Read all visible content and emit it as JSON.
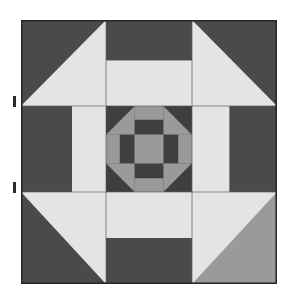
{
  "canvas": {
    "width": 287,
    "height": 297,
    "background": "#ffffff",
    "title": "Quilt Block Pattern"
  },
  "palette": {
    "dark": "#4a4a4a",
    "darker": "#3f3f3f",
    "medium": "#9a9a9a",
    "medium_light": "#a8a8a8",
    "light": "#e4e4e4",
    "light_alt": "#e0e0e0",
    "outline": "#2a2a2a",
    "grid_line": "#5a5a5a",
    "background": "#ffffff"
  },
  "block": {
    "name": "nine-patch-quilt-block",
    "x": 21,
    "y": 20,
    "width": 256,
    "height": 264,
    "grid": 3,
    "grid_x": [
      21,
      106,
      192,
      277
    ],
    "grid_y": [
      20,
      106,
      192,
      284
    ],
    "outline_color": "#2a2a2a",
    "outline_width": 1.6
  },
  "units": {
    "corners": [
      {
        "name": "corner-top-left",
        "type": "half-square-triangle",
        "x": 21,
        "y": 20,
        "w": 85,
        "h": 86,
        "triangle_a_color": "#4a4a4a",
        "triangle_b_color": "#e4e4e4",
        "diagonal": "tl-br",
        "point_direction": "inward"
      },
      {
        "name": "corner-top-right",
        "type": "half-square-triangle",
        "x": 192,
        "y": 20,
        "w": 85,
        "h": 86,
        "triangle_a_color": "#4a4a4a",
        "triangle_b_color": "#e4e4e4",
        "diagonal": "tr-bl",
        "point_direction": "inward"
      },
      {
        "name": "corner-bottom-left",
        "type": "half-square-triangle",
        "x": 21,
        "y": 192,
        "w": 85,
        "h": 92,
        "triangle_a_color": "#4a4a4a",
        "triangle_b_color": "#e4e4e4",
        "diagonal": "tr-bl",
        "point_direction": "inward"
      },
      {
        "name": "corner-bottom-right",
        "type": "half-square-triangle",
        "x": 192,
        "y": 192,
        "w": 85,
        "h": 92,
        "triangle_a_color": "#9a9a9a",
        "triangle_b_color": "#e4e4e4",
        "diagonal": "tl-br",
        "point_direction": "inward"
      }
    ],
    "edges": [
      {
        "name": "edge-top-center",
        "type": "split-rectangle",
        "x": 106,
        "y": 20,
        "w": 86,
        "h": 86,
        "outer_color": "#4a4a4a",
        "inner_color": "#e4e4e4",
        "split_fraction": 0.47,
        "orientation": "horizontal-outer-top"
      },
      {
        "name": "edge-middle-left",
        "type": "split-rectangle",
        "x": 21,
        "y": 106,
        "w": 85,
        "h": 86,
        "outer_color": "#4a4a4a",
        "inner_color": "#e4e4e4",
        "split_fraction": 0.6,
        "orientation": "vertical-outer-left"
      },
      {
        "name": "edge-middle-right",
        "type": "split-rectangle",
        "x": 192,
        "y": 106,
        "w": 85,
        "h": 86,
        "outer_color": "#4a4a4a",
        "inner_color": "#e4e4e4",
        "split_fraction": 0.56,
        "orientation": "vertical-outer-right"
      },
      {
        "name": "edge-bottom-center",
        "type": "split-rectangle",
        "x": 106,
        "y": 192,
        "w": 86,
        "h": 92,
        "outer_color": "#4a4a4a",
        "inner_color": "#e4e4e4",
        "split_fraction": 0.5,
        "orientation": "horizontal-outer-bottom"
      }
    ],
    "medallion": {
      "name": "center-medallion",
      "type": "churn-dash-shoofly",
      "x": 106,
      "y": 106,
      "w": 86,
      "h": 86,
      "background_color": "#9a9a9a",
      "cell": 28.67,
      "corners": [
        {
          "name": "medallion-corner-top-left",
          "diagonal": "tl-br",
          "dark_color": "#3f3f3f",
          "light_color": "#9a9a9a"
        },
        {
          "name": "medallion-corner-top-right",
          "diagonal": "tr-bl",
          "dark_color": "#3f3f3f",
          "light_color": "#9a9a9a"
        },
        {
          "name": "medallion-corner-bottom-left",
          "diagonal": "tr-bl",
          "dark_color": "#3f3f3f",
          "light_color": "#9a9a9a"
        },
        {
          "name": "medallion-corner-bottom-right",
          "diagonal": "tl-br",
          "dark_color": "#3f3f3f",
          "light_color": "#9a9a9a"
        }
      ],
      "bars": [
        {
          "name": "medallion-bar-top",
          "bar_color": "#3f3f3f",
          "fill_color": "#9a9a9a",
          "orientation": "horizontal",
          "bar_side": "inner"
        },
        {
          "name": "medallion-bar-bottom",
          "bar_color": "#3f3f3f",
          "fill_color": "#9a9a9a",
          "orientation": "horizontal",
          "bar_side": "inner"
        },
        {
          "name": "medallion-bar-left",
          "bar_color": "#3f3f3f",
          "fill_color": "#9a9a9a",
          "orientation": "vertical",
          "bar_side": "inner"
        },
        {
          "name": "medallion-bar-right",
          "bar_color": "#3f3f3f",
          "fill_color": "#9a9a9a",
          "orientation": "vertical",
          "bar_side": "inner"
        }
      ],
      "center": {
        "name": "medallion-center-square",
        "color": "#9a9a9a"
      }
    }
  },
  "markers": [
    {
      "name": "edge-marker-upper",
      "x": 13,
      "y": 96,
      "w": 3,
      "h": 11,
      "color": "#2a2a2a"
    },
    {
      "name": "edge-marker-lower",
      "x": 13,
      "y": 182,
      "w": 3,
      "h": 11,
      "color": "#2a2a2a"
    }
  ]
}
